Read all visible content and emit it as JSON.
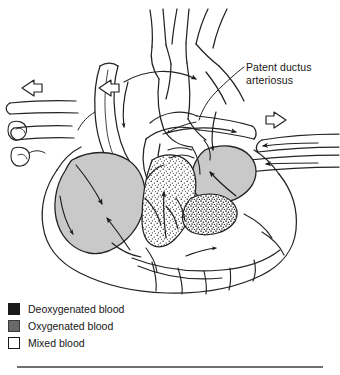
{
  "figure": {
    "annotations": [
      {
        "id": "pda",
        "text": "Patent ductus\narteriosus"
      }
    ],
    "structures": [
      "aortic arch",
      "brachiocephalic branches",
      "ascending aorta",
      "descending aorta",
      "pulmonary trunk",
      "ductus arteriosus",
      "superior vena cava",
      "inferior vena cava",
      "pulmonary veins",
      "left atrium",
      "right atrium",
      "left ventricle",
      "right ventricle",
      "interventricular septum",
      "coronary vessels"
    ],
    "flow_arrows": [
      "pulmonary-vein-inflow-left",
      "pulmonary-vein-inflow-left-lower",
      "vena-cava-inflow-right",
      "aortic-arch-outflow",
      "ductus-shunt-flow",
      "left-ventricle-outflow",
      "right-ventricle-outflow"
    ]
  },
  "legend": {
    "items": [
      {
        "label": "Deoxygenated blood",
        "swatch": "solid-black",
        "color": "#1a1a1a"
      },
      {
        "label": "Oxygenated blood",
        "swatch": "solid-gray",
        "color": "#6a6a6a"
      },
      {
        "label": "Mixed blood",
        "swatch": "outline-white",
        "color": "#ffffff"
      }
    ]
  },
  "colors": {
    "ink": "#1a1a1a",
    "line": "#232323",
    "oxygenated_fill": "#c9c9c9",
    "mixed_stipple": "#2b2b2b",
    "rule": "#6f6f6f",
    "background": "#ffffff"
  }
}
